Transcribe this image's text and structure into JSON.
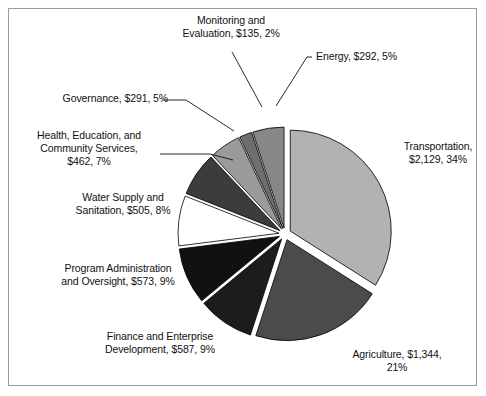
{
  "chart_data": {
    "type": "pie",
    "title": "",
    "subtitle": "",
    "xlabel": "",
    "ylabel": "",
    "legend_position": "none",
    "grid": false,
    "units": "millions of dollars",
    "total_value": 6318,
    "categories": [
      "Transportation",
      "Agriculture",
      "Finance and Enterprise Development",
      "Program Administration and Oversight",
      "Water Supply and Sanitation",
      "Health, Education, and Community Services",
      "Governance",
      "Monitoring and Evaluation",
      "Energy"
    ],
    "values": [
      2129,
      1344,
      587,
      573,
      505,
      462,
      291,
      135,
      292
    ],
    "percents": [
      34,
      21,
      9,
      9,
      8,
      7,
      5,
      2,
      5
    ],
    "slices": [
      {
        "name": "Transportation",
        "value": 2129,
        "value_text": "$2,129",
        "percent": 34,
        "percent_text": "34%",
        "label": "Transportation,\n$2,129, 34%",
        "color": "#b2b2b2"
      },
      {
        "name": "Agriculture",
        "value": 1344,
        "value_text": "$1,344",
        "percent": 21,
        "percent_text": "21%",
        "label": "Agriculture, $1,344,\n21%",
        "color": "#4b4b4b"
      },
      {
        "name": "Finance and Enterprise Development",
        "value": 587,
        "value_text": "$587",
        "percent": 9,
        "percent_text": "9%",
        "label": "Finance and Enterprise\nDevelopment, $587, 9%",
        "color": "#1c1c1c"
      },
      {
        "name": "Program Administration and Oversight",
        "value": 573,
        "value_text": "$573",
        "percent": 9,
        "percent_text": "9%",
        "label": "Program Administration\nand Oversight, $573, 9%",
        "color": "#111111"
      },
      {
        "name": "Water Supply and Sanitation",
        "value": 505,
        "value_text": "$505",
        "percent": 8,
        "percent_text": "8%",
        "label": "Water Supply and\nSanitation, $505, 8%",
        "color": "#ffffff"
      },
      {
        "name": "Health, Education, and Community Services",
        "value": 462,
        "value_text": "$462",
        "percent": 7,
        "percent_text": "7%",
        "label": "Health, Education, and\nCommunity Services,\n$462, 7%",
        "color": "#3c3c3c"
      },
      {
        "name": "Governance",
        "value": 291,
        "value_text": "$291",
        "percent": 5,
        "percent_text": "5%",
        "label": "Governance, $291, 5%",
        "color": "#9a9a9a"
      },
      {
        "name": "Monitoring and Evaluation",
        "value": 135,
        "value_text": "$135",
        "percent": 2,
        "percent_text": "2%",
        "label": "Monitoring and\nEvaluation, $135, 2%",
        "color": "#6e6e6e"
      },
      {
        "name": "Energy",
        "value": 292,
        "value_text": "$292",
        "percent": 5,
        "percent_text": "5%",
        "label": "Energy, $292, 5%",
        "color": "#878787"
      }
    ]
  },
  "figure": {
    "border_color": "#9b9b9b",
    "background": "#ffffff",
    "slice_outline": "#000000"
  }
}
